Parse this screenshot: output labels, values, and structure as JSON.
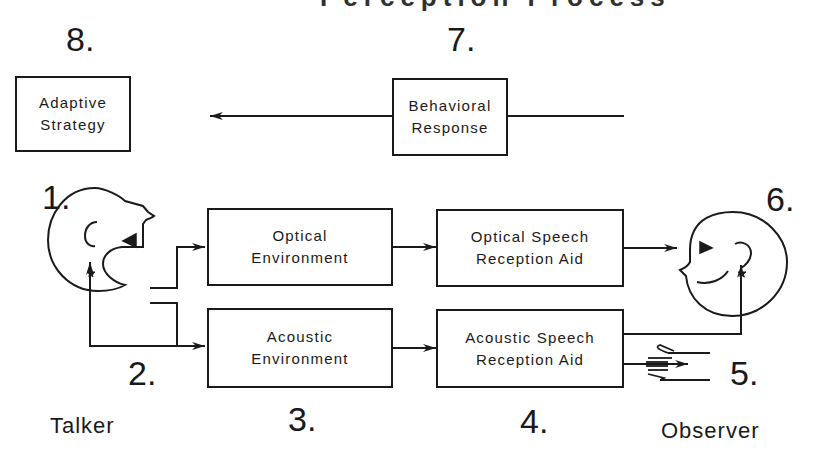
{
  "diagram": {
    "title_fragment": "Perception Process",
    "nodes": {
      "adaptive_strategy": {
        "number": "8.",
        "lines": [
          "Adaptive",
          "Strategy"
        ]
      },
      "behavioral_response": {
        "number": "7.",
        "lines": [
          "Behavioral",
          "Response"
        ]
      },
      "optical_environment": {
        "lines": [
          "Optical",
          "Environment"
        ]
      },
      "acoustic_environment": {
        "lines": [
          "Acoustic",
          "Environment"
        ]
      },
      "optical_aid": {
        "lines": [
          "Optical Speech",
          "Reception Aid"
        ]
      },
      "acoustic_aid": {
        "lines": [
          "Acoustic Speech",
          "Reception Aid"
        ]
      }
    },
    "numbers": {
      "talker": "1.",
      "feedback": "2.",
      "environment": "3.",
      "aid": "4.",
      "tactile": "5.",
      "observer": "6."
    },
    "roles": {
      "talker": "Talker",
      "observer": "Observer"
    },
    "edges": [
      {
        "from": "behavioral_response",
        "to": "adaptive_strategy"
      },
      {
        "from": "talker",
        "to": "optical_environment"
      },
      {
        "from": "talker",
        "to": "acoustic_environment"
      },
      {
        "from": "talker_mouth",
        "to": "talker_ear",
        "label": "2."
      },
      {
        "from": "optical_environment",
        "to": "optical_aid"
      },
      {
        "from": "acoustic_environment",
        "to": "acoustic_aid"
      },
      {
        "from": "optical_aid",
        "to": "observer_eye"
      },
      {
        "from": "acoustic_aid",
        "to": "observer_ear"
      },
      {
        "from": "acoustic_aid",
        "to": "observer_hand",
        "label": "5."
      }
    ],
    "colors": {
      "ink": "#1a1a1a",
      "background": "#ffffff"
    }
  }
}
